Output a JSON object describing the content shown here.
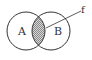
{
  "diagram": {
    "type": "venn",
    "sets": [
      {
        "label": "A",
        "cx": 26,
        "cy": 31,
        "r": 19
      },
      {
        "label": "B",
        "cx": 51,
        "cy": 31,
        "r": 19
      }
    ],
    "intersection": {
      "shaded": true,
      "pattern": "hatched"
    },
    "annotation": {
      "label": "f",
      "points_to": "intersection"
    },
    "colors": {
      "stroke": "#333333",
      "shade": "#aaaaaa",
      "background": "#ffffff"
    }
  }
}
